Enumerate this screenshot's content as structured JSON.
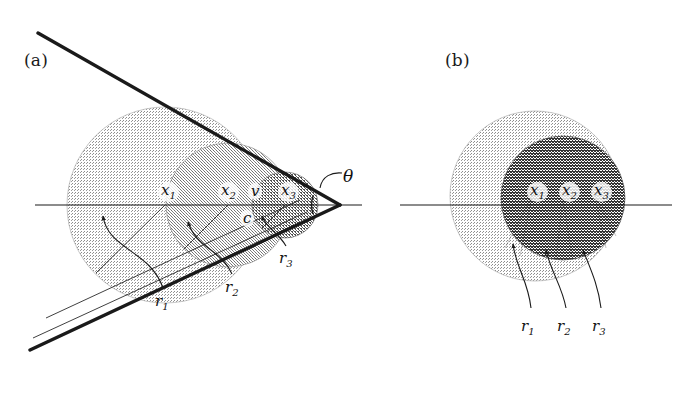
{
  "figure": {
    "background_color": "#ffffff",
    "ink_color": "#1a1a1a",
    "shade_light": "#b4b4b4",
    "shade_mid": "#9a9a9a",
    "shade_dark": "#6e6e6e",
    "shade_darkest": "#4d4d4d"
  },
  "panels": [
    {
      "id": "a",
      "label": "(a)",
      "label_x": 24,
      "label_y": 50,
      "description": "Cone with apex at right; three nested shaded disks centered on the axis",
      "apex": {
        "x": 340,
        "y": 205
      },
      "axis": {
        "x1": 35,
        "y1": 205,
        "x2": 360,
        "y2": 205
      },
      "cone": {
        "half_angle_deg": 28,
        "upper_line": {
          "x1": 38,
          "y1": 33,
          "x2": 340,
          "y2": 205
        },
        "lower_line": {
          "x1": 30,
          "y1": 350,
          "x2": 340,
          "y2": 205
        }
      },
      "angle_marker": {
        "label": "θ",
        "x": 347,
        "y": 168
      },
      "disks": [
        {
          "name": "r1-disk",
          "cx": 165,
          "cy": 205,
          "r": 98,
          "shade": "#b4b4b4"
        },
        {
          "name": "r2-disk",
          "cx": 228,
          "cy": 205,
          "r": 62,
          "shade": "#9a9a9a"
        },
        {
          "name": "r3-disk",
          "cx": 285,
          "cy": 205,
          "r": 33,
          "shade": "#6e6e6e"
        }
      ],
      "point_labels": [
        {
          "text": "x",
          "sub": "1",
          "x": 158,
          "y": 183
        },
        {
          "text": "x",
          "sub": "2",
          "x": 218,
          "y": 183
        },
        {
          "text": "v",
          "sub": "",
          "x": 248,
          "y": 184
        },
        {
          "text": "x",
          "sub": "3",
          "x": 278,
          "y": 183
        },
        {
          "text": "c",
          "sub": "",
          "x": 240,
          "y": 212
        }
      ],
      "radius_labels": [
        {
          "text": "r",
          "sub": "1",
          "x": 158,
          "y": 296
        },
        {
          "text": "r",
          "sub": "2",
          "x": 228,
          "y": 282
        },
        {
          "text": "r",
          "sub": "3",
          "x": 282,
          "y": 253
        }
      ]
    },
    {
      "id": "b",
      "label": "(b)",
      "label_x": 445,
      "label_y": 50,
      "description": "Two concentric-ish shaded disks with three small labelled points on the axis",
      "axis": {
        "x1": 400,
        "y1": 205,
        "x2": 670,
        "y2": 205
      },
      "disks": [
        {
          "name": "outer-disk",
          "cx": 535,
          "cy": 196,
          "r": 85,
          "shade": "#b4b4b4"
        },
        {
          "name": "inner-disk",
          "cx": 563,
          "cy": 198,
          "r": 62,
          "shade": "#4d4d4d"
        }
      ],
      "point_labels": [
        {
          "text": "x",
          "sub": "1",
          "x": 527,
          "y": 183
        },
        {
          "text": "x",
          "sub": "2",
          "x": 559,
          "y": 183
        },
        {
          "text": "x",
          "sub": "3",
          "x": 591,
          "y": 183
        }
      ],
      "radius_labels": [
        {
          "text": "r",
          "sub": "1",
          "x": 524,
          "y": 321
        },
        {
          "text": "r",
          "sub": "2",
          "x": 560,
          "y": 321
        },
        {
          "text": "r",
          "sub": "3",
          "x": 595,
          "y": 321
        }
      ]
    }
  ]
}
